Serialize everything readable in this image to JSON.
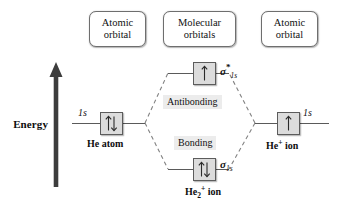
{
  "diagram": {
    "type": "molecular-orbital-diagram",
    "width": 338,
    "height": 208,
    "background_color": "#ffffff"
  },
  "categories": {
    "left": {
      "line1": "Atomic",
      "line2": "orbital"
    },
    "middle": {
      "line1": "Molecular",
      "line2": "orbitals"
    },
    "right": {
      "line1": "Atomic",
      "line2": "orbital"
    }
  },
  "axis": {
    "label": "Energy",
    "direction": "up",
    "arrow_color": "#3a3a3a"
  },
  "levels": {
    "ao_left": {
      "orbital_label": "1s",
      "species": "He atom",
      "electrons": 2,
      "spins": "up-down",
      "box_fill": "#dcdcdc"
    },
    "ao_right": {
      "orbital_label": "1s",
      "species_text": "He",
      "species_superscript": "+",
      "species_suffix": " ion",
      "electrons": 1,
      "spins": "up",
      "box_fill": "#dcdcdc"
    },
    "mo_antibonding": {
      "sigma": "σ",
      "star": "*",
      "subscript": "1s",
      "type_label": "Antibonding",
      "electrons": 1,
      "spins": "up",
      "box_fill": "#dcdcdc"
    },
    "mo_bonding": {
      "sigma": "σ",
      "star": "",
      "subscript": "1s",
      "type_label": "Bonding",
      "electrons": 2,
      "spins": "up-down",
      "box_fill": "#dcdcdc"
    },
    "molecule": {
      "text": "He",
      "subscript": "2",
      "superscript": "+",
      "suffix": " ion"
    }
  },
  "style": {
    "line_color": "#5a5a5a",
    "dash_color": "#7a7a7a",
    "highlight_bg": "#ececec",
    "text_color": "#111111"
  }
}
